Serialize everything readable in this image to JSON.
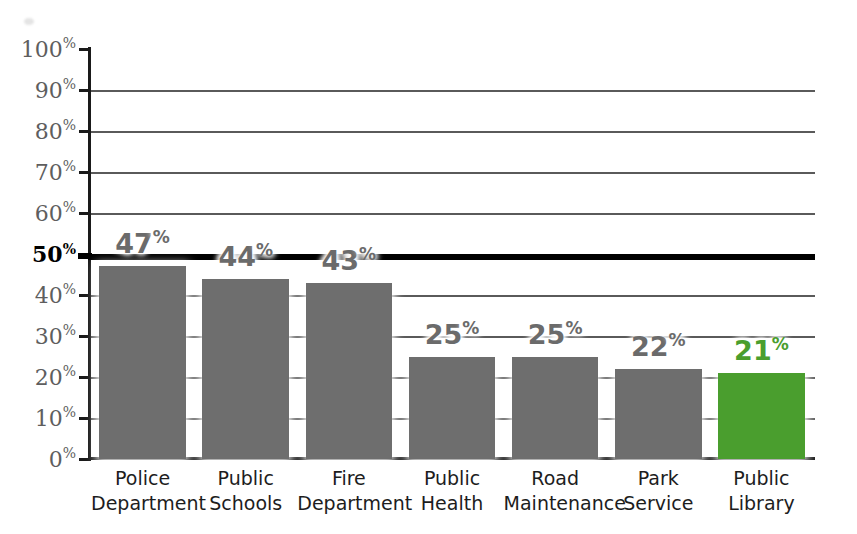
{
  "chart_data": {
    "type": "bar",
    "title": "",
    "subtitle": "",
    "xlabel": "",
    "ylabel": "",
    "ylim": [
      0,
      100
    ],
    "grid": true,
    "legend": "none",
    "value_suffix": "%",
    "emphasis_line": {
      "value": 50,
      "style": "thick-black"
    },
    "categories": [
      "Police Department",
      "Public Schools",
      "Fire Department",
      "Public Health",
      "Road Maintenance",
      "Park Service",
      "Public Library"
    ],
    "category_lines": [
      [
        "Police",
        "Department"
      ],
      [
        "Public",
        "Schools"
      ],
      [
        "Fire",
        "Department"
      ],
      [
        "Public",
        "Health"
      ],
      [
        "Road",
        "Maintenance"
      ],
      [
        "Park",
        "Service"
      ],
      [
        "Public",
        "Library"
      ]
    ],
    "values": [
      47,
      44,
      43,
      25,
      25,
      22,
      21
    ],
    "value_labels": [
      "47",
      "44",
      "43",
      "25",
      "25",
      "22",
      "21"
    ],
    "bar_colors": [
      "#6e6e6e",
      "#6e6e6e",
      "#6e6e6e",
      "#6e6e6e",
      "#6e6e6e",
      "#6e6e6e",
      "#4a9e2e"
    ],
    "highlight_index": 6,
    "yticks": [
      0,
      10,
      20,
      30,
      40,
      50,
      60,
      70,
      80,
      90,
      100
    ],
    "ytick_labels": [
      "0",
      "10",
      "20",
      "30",
      "40",
      "50",
      "60",
      "70",
      "80",
      "90",
      "100"
    ],
    "ytick_suffix": "%",
    "ytick_bold": [
      50
    ]
  },
  "colors": {
    "bar_gray": "#6e6e6e",
    "bar_green": "#4a9e2e",
    "axis": "#1a1a1a",
    "gridline": "#5a5a5a",
    "gridline_major": "#000000",
    "ytick_text": "#5e6e5e",
    "value_text": "#6b6b6b",
    "category_text": "#1d1d1d",
    "background": "#ffffff"
  }
}
